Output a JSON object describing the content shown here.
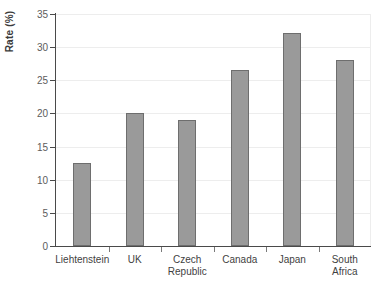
{
  "chart_data": {
    "type": "bar",
    "title": "",
    "xlabel": "",
    "ylabel": "Rate (%)",
    "categories": [
      "Liehtenstein",
      "UK",
      "Czech\nRepublic",
      "Canada",
      "Japan",
      "South Africa"
    ],
    "values": [
      12.5,
      20,
      19,
      26.6,
      32.2,
      28
    ],
    "ylim": [
      0,
      35
    ],
    "ytick_labels": [
      "0",
      "5",
      "10",
      "15",
      "20",
      "25",
      "30",
      "35"
    ],
    "ytick_values": [
      0,
      5,
      10,
      15,
      20,
      25,
      30,
      35
    ],
    "grid": true,
    "legend": "none",
    "bar_color": "#9a9a9a",
    "bar_edge_color": "#6e6e6e",
    "axis_color": "#4a4a4a",
    "grid_color": "#ededed",
    "background": "#ffffff"
  }
}
